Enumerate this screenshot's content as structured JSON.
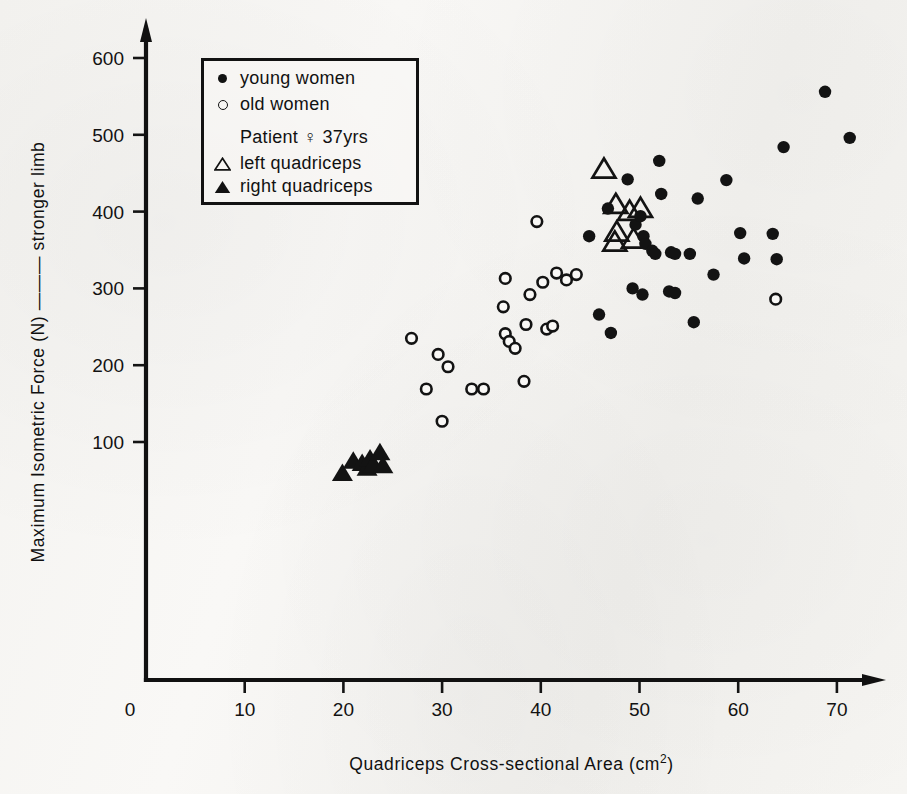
{
  "chart_data": {
    "type": "scatter",
    "title": "",
    "xlabel": "Quadriceps Cross-sectional Area  (cm2)",
    "xlabel_main": "Quadriceps Cross-sectional Area  (cm",
    "xlabel_sup": "2",
    "xlabel_tail": ")",
    "ylabel": "Maximum Isometric Force  (N) —— stronger limb",
    "xlim": [
      0,
      73
    ],
    "ylim": [
      0,
      640
    ],
    "xticks": [
      0,
      10,
      20,
      30,
      40,
      50,
      60,
      70
    ],
    "xtick_labels": [
      "0",
      "10",
      "20",
      "30",
      "40",
      "50",
      "60",
      "70"
    ],
    "yticks": [
      100,
      200,
      300,
      400,
      500,
      600
    ],
    "ytick_labels": [
      "100",
      "200",
      "300",
      "400",
      "500",
      "600"
    ],
    "grid": false,
    "legend_position": "upper-left-inside",
    "series": [
      {
        "name": "young women",
        "marker": "filled-circle",
        "color": "#131313",
        "points": [
          [
            46.8,
            404
          ],
          [
            48.8,
            442
          ],
          [
            49.6,
            383
          ],
          [
            50.1,
            394
          ],
          [
            50.4,
            368
          ],
          [
            50.6,
            358
          ],
          [
            51.3,
            349
          ],
          [
            51.6,
            345
          ],
          [
            52.0,
            466
          ],
          [
            52.2,
            423
          ],
          [
            53.2,
            347
          ],
          [
            53.6,
            345
          ],
          [
            45.9,
            266
          ],
          [
            47.1,
            242
          ],
          [
            49.3,
            300
          ],
          [
            50.3,
            292
          ],
          [
            53.0,
            296
          ],
          [
            53.6,
            294
          ],
          [
            55.5,
            256
          ],
          [
            55.9,
            417
          ],
          [
            57.5,
            318
          ],
          [
            58.8,
            441
          ],
          [
            60.2,
            372
          ],
          [
            60.6,
            339
          ],
          [
            63.5,
            371
          ],
          [
            63.9,
            338
          ],
          [
            64.6,
            484
          ],
          [
            68.8,
            556
          ],
          [
            71.3,
            496
          ],
          [
            55.1,
            345
          ],
          [
            44.9,
            368
          ]
        ]
      },
      {
        "name": "old women",
        "marker": "open-circle",
        "color": "#131313",
        "points": [
          [
            26.9,
            235
          ],
          [
            28.4,
            169
          ],
          [
            29.6,
            214
          ],
          [
            30.0,
            127
          ],
          [
            30.6,
            198
          ],
          [
            33.0,
            169
          ],
          [
            34.2,
            169
          ],
          [
            36.4,
            313
          ],
          [
            36.2,
            276
          ],
          [
            36.4,
            241
          ],
          [
            36.8,
            231
          ],
          [
            37.4,
            222
          ],
          [
            38.5,
            253
          ],
          [
            38.3,
            179
          ],
          [
            39.6,
            387
          ],
          [
            40.6,
            247
          ],
          [
            40.2,
            308
          ],
          [
            41.2,
            251
          ],
          [
            41.6,
            320
          ],
          [
            42.6,
            311
          ],
          [
            43.6,
            318
          ],
          [
            63.8,
            286
          ],
          [
            38.9,
            292
          ]
        ]
      },
      {
        "name": "left quadriceps",
        "marker": "open-triangle",
        "color": "#131313",
        "points": [
          [
            46.4,
            455
          ],
          [
            47.6,
            409
          ],
          [
            49.0,
            400
          ],
          [
            50.1,
            404
          ],
          [
            47.7,
            373
          ],
          [
            47.5,
            360
          ],
          [
            49.4,
            364
          ]
        ]
      },
      {
        "name": "right quadriceps",
        "marker": "filled-triangle",
        "color": "#131313",
        "points": [
          [
            19.9,
            59
          ],
          [
            21.0,
            75
          ],
          [
            21.9,
            72
          ],
          [
            22.4,
            66
          ],
          [
            22.7,
            78
          ],
          [
            23.0,
            70
          ],
          [
            23.7,
            86
          ],
          [
            24.0,
            69
          ]
        ]
      }
    ]
  },
  "legend": {
    "items": [
      {
        "marker": "filled-circle",
        "label": "young women"
      },
      {
        "marker": "open-circle",
        "label": "old women"
      }
    ],
    "patient_heading": "Patient  ♀  37yrs",
    "patient_items": [
      {
        "marker": "open-triangle",
        "label": "left quadriceps"
      },
      {
        "marker": "filled-triangle",
        "label": "right quadriceps"
      }
    ]
  },
  "axes": {
    "y_title_main": "Maximum Isometric Force  (N)",
    "y_title_dash": "———",
    "y_title_tail": "stronger limb"
  },
  "colors": {
    "ink": "#131313",
    "paper": "#f7f6f4"
  }
}
